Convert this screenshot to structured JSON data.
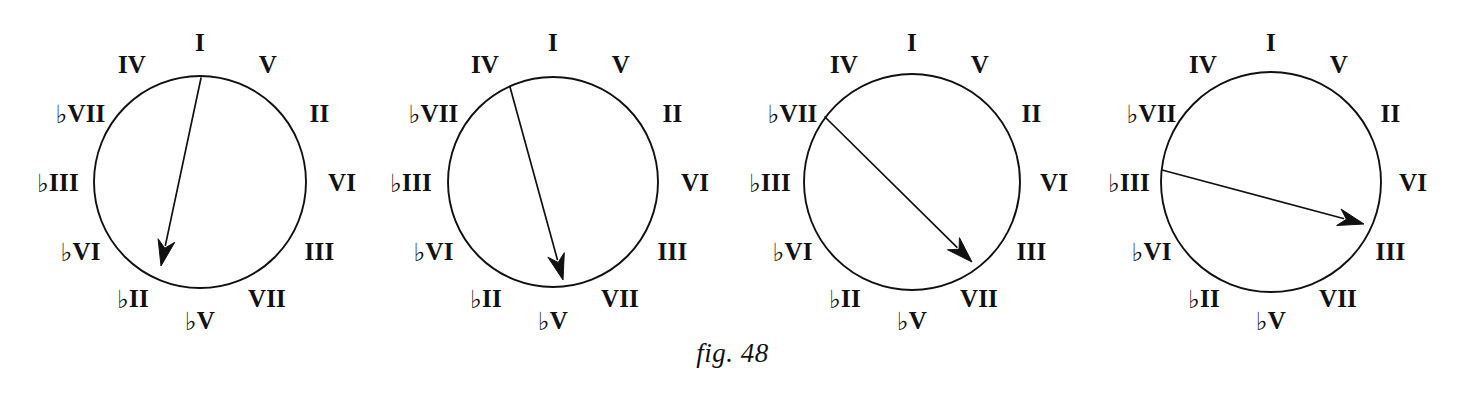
{
  "figure": {
    "caption": "fig. 48",
    "caption_y": 338,
    "background_color": "#ffffff",
    "ink_color": "#111111",
    "flat_symbol": "♭"
  },
  "chart_data": {
    "type": "diagram",
    "title": "fig. 48",
    "clock_positions_deg": [
      0,
      30,
      60,
      90,
      120,
      150,
      180,
      210,
      240,
      270,
      300,
      330
    ],
    "degree_ring": [
      {
        "position": 0,
        "angle_deg": 0,
        "roman": "I",
        "flat": false,
        "label": "I"
      },
      {
        "position": 1,
        "angle_deg": 30,
        "roman": "V",
        "flat": false,
        "label": "V"
      },
      {
        "position": 2,
        "angle_deg": 60,
        "roman": "II",
        "flat": false,
        "label": "II"
      },
      {
        "position": 3,
        "angle_deg": 90,
        "roman": "VI",
        "flat": false,
        "label": "VI"
      },
      {
        "position": 4,
        "angle_deg": 120,
        "roman": "III",
        "flat": false,
        "label": "III"
      },
      {
        "position": 5,
        "angle_deg": 150,
        "roman": "VII",
        "flat": false,
        "label": "VII"
      },
      {
        "position": 6,
        "angle_deg": 180,
        "roman": "V",
        "flat": true,
        "label": "♭V"
      },
      {
        "position": 7,
        "angle_deg": 210,
        "roman": "II",
        "flat": true,
        "label": "♭II"
      },
      {
        "position": 8,
        "angle_deg": 240,
        "roman": "VI",
        "flat": true,
        "label": "♭VI"
      },
      {
        "position": 9,
        "angle_deg": 270,
        "roman": "III",
        "flat": true,
        "label": "♭III"
      },
      {
        "position": 10,
        "angle_deg": 300,
        "roman": "VII",
        "flat": true,
        "label": "♭VII"
      },
      {
        "position": 11,
        "angle_deg": 330,
        "roman": "IV",
        "flat": false,
        "label": "IV"
      }
    ],
    "circles": [
      {
        "index": 1,
        "name": "circle-i-to-flat-ii",
        "center_x": 200,
        "center_y": 182,
        "radius": 106,
        "arrow": {
          "from_label": "I",
          "to_label": "♭II",
          "from_position": 0,
          "to_position": 7,
          "x1": 201,
          "y1": 78,
          "x2": 161,
          "y2": 266
        }
      },
      {
        "index": 2,
        "name": "circle-iv-to-flat-v",
        "center_x": 553,
        "center_y": 182,
        "radius": 105,
        "arrow": {
          "from_label": "IV",
          "to_label": "♭V",
          "from_position": 11,
          "to_position": 6,
          "x1": 510,
          "y1": 87,
          "x2": 563,
          "y2": 280
        }
      },
      {
        "index": 3,
        "name": "circle-flat-vii-to-vii",
        "center_x": 912,
        "center_y": 182,
        "radius": 108,
        "arrow": {
          "from_label": "♭VII",
          "to_label": "VII",
          "from_position": 10,
          "to_position": 5,
          "x1": 825,
          "y1": 117,
          "x2": 972,
          "y2": 262
        }
      },
      {
        "index": 4,
        "name": "circle-flat-iii-to-iii",
        "center_x": 1271,
        "center_y": 182,
        "radius": 110,
        "arrow": {
          "from_label": "♭III",
          "to_label": "III",
          "from_position": 9,
          "to_position": 4,
          "x1": 1162,
          "y1": 170,
          "x2": 1364,
          "y2": 224
        }
      }
    ]
  }
}
